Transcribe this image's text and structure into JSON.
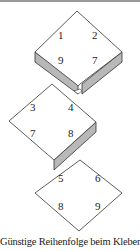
{
  "colors": {
    "stroke": "#333333",
    "face": "#ffffff",
    "side": "#b8b8b8",
    "text": "#1a1a1a"
  },
  "pieces": [
    {
      "name": "top-piece",
      "labels": [
        "1",
        "2",
        "9",
        "7"
      ],
      "thickness_edges": [
        "bottom-left",
        "bottom-right"
      ]
    },
    {
      "name": "middle-piece",
      "labels": [
        "3",
        "4",
        "7",
        "8"
      ],
      "thickness_edges": [
        "bottom-right"
      ]
    },
    {
      "name": "bottom-piece",
      "labels": [
        "5",
        "6",
        "8",
        "9"
      ],
      "thickness_edges": []
    }
  ],
  "caption": "Günstige Reihenfolge beim Kleben:"
}
